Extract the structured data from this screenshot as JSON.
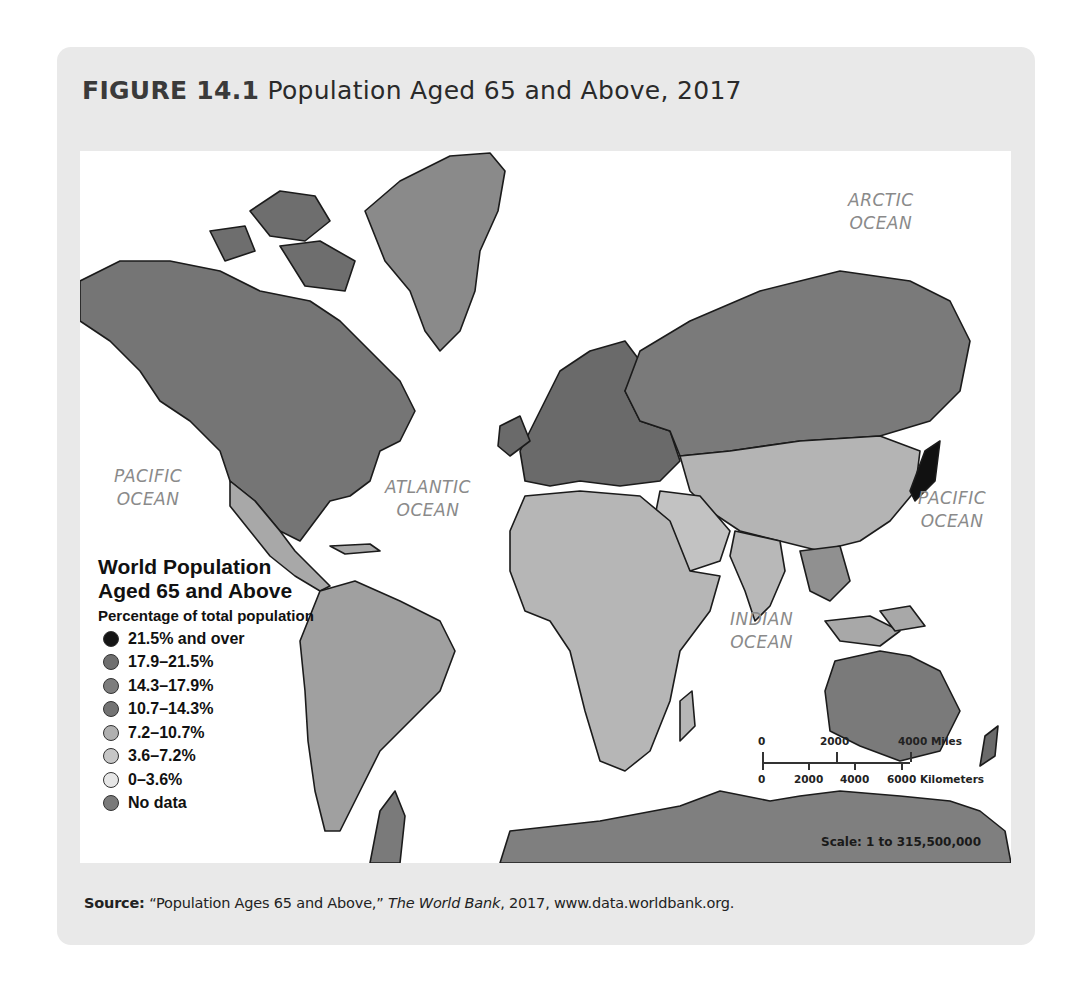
{
  "figure": {
    "number_label": "FIGURE 14.1",
    "title": "Population Aged 65 and Above, 2017"
  },
  "map": {
    "type": "choropleth-world-map",
    "projection": "Mercator",
    "ocean_labels": [
      {
        "line1": "ARCTIC",
        "line2": "OCEAN"
      },
      {
        "line1": "PACIFIC",
        "line2": "OCEAN"
      },
      {
        "line1": "ATLANTIC",
        "line2": "OCEAN"
      },
      {
        "line1": "PACIFIC",
        "line2": "OCEAN"
      },
      {
        "line1": "INDIAN",
        "line2": "OCEAN"
      }
    ],
    "legend": {
      "title_line1": "World Population",
      "title_line2": "Aged 65 and Above",
      "subtitle": "Percentage of total population",
      "classes": [
        {
          "label": "21.5% and over",
          "color": "#151515"
        },
        {
          "label": "17.9–21.5%",
          "color": "#6f6f6f"
        },
        {
          "label": "14.3–17.9%",
          "color": "#7d7d7d"
        },
        {
          "label": "10.7–14.3%",
          "color": "#737373"
        },
        {
          "label": "7.2–10.7%",
          "color": "#b0b0b0"
        },
        {
          "label": "3.6–7.2%",
          "color": "#c6c6c6"
        },
        {
          "label": "0–3.6%",
          "color": "#e6e6e6"
        },
        {
          "label": "No data",
          "color": "#7a7a7a"
        }
      ]
    },
    "scale_bar": {
      "miles_labels": [
        "0",
        "2000",
        "4000 Miles"
      ],
      "km_labels": [
        "0",
        "2000",
        "4000",
        "6000 Kilometers"
      ],
      "ratio": "Scale: 1 to 315,500,000"
    }
  },
  "source": {
    "label": "Source:",
    "quote": "“Population Ages 65 and Above,”",
    "publisher": "The World Bank",
    "rest": ", 2017, www.data.worldbank.org."
  }
}
